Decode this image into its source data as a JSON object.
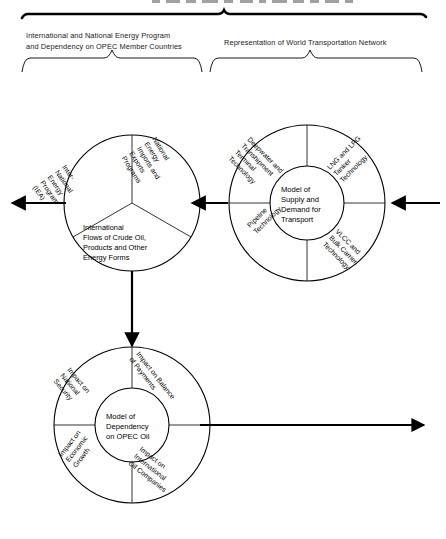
{
  "figure": {
    "title_cut_off": "",
    "braces": [
      {
        "id": "left",
        "label": "International and National Energy Program and Dependency on OPEC Member Countries",
        "line1": "International and National Energy Program",
        "line2": "and Dependency on OPEC Member Countries"
      },
      {
        "id": "right",
        "label": "Representation of World Transportation Network",
        "line1": "Representation of World Transportation Network",
        "line2": ""
      }
    ]
  },
  "diagram": {
    "energy_circle": {
      "name": "International and National Energy Programs circle",
      "segments": [
        {
          "id": "iea",
          "lines": [
            "Inter-",
            "National",
            "Energy",
            "Program",
            "(IEA)"
          ]
        },
        {
          "id": "imports",
          "lines": [
            "National",
            "Energy",
            "Imports and",
            "Exports",
            "Programs"
          ]
        },
        {
          "id": "flows",
          "lines": [
            "International",
            "Flows of Crude Oil,",
            "Products and Other",
            "Energy Forms"
          ]
        }
      ]
    },
    "transport_circle": {
      "name": "Model of Supply and Demand for Transport",
      "core": [
        "Model of",
        "Supply and",
        "Demand for",
        "Transport"
      ],
      "quadrants": [
        {
          "id": "deepwater",
          "lines": [
            "Deepwater and",
            "Transhipment",
            "Terminal",
            "Technology"
          ]
        },
        {
          "id": "lng_lpg",
          "lines": [
            "LNG and LPG",
            "Tanker",
            "Technology"
          ]
        },
        {
          "id": "pipeline",
          "lines": [
            "Pipeline",
            "Technology"
          ]
        },
        {
          "id": "vlcc",
          "lines": [
            "VLCC and",
            "Bulk Carrier",
            "Technology"
          ]
        }
      ]
    },
    "dependency_circle": {
      "name": "Model of Dependency on OPEC Oil",
      "core": [
        "Model of",
        "Dependency",
        "on OPEC Oil"
      ],
      "quadrants": [
        {
          "id": "national_security",
          "lines": [
            "Impact on",
            "National",
            "Security"
          ]
        },
        {
          "id": "balance_payments",
          "lines": [
            "Impact on Balance",
            "of Payments"
          ]
        },
        {
          "id": "economic_growth",
          "lines": [
            "Impact on",
            "Economic",
            "Growth"
          ]
        },
        {
          "id": "oil_companies",
          "lines": [
            "Impact on",
            "International",
            "Oil Companies"
          ]
        }
      ]
    },
    "arrows": [
      {
        "id": "arrow-right-in",
        "direction": "left"
      },
      {
        "id": "arrow-transport-to-energy",
        "direction": "left"
      },
      {
        "id": "arrow-energy-out",
        "direction": "left"
      },
      {
        "id": "arrow-energy-to-dependency",
        "direction": "down"
      },
      {
        "id": "arrow-dependency-out",
        "direction": "right"
      }
    ]
  },
  "colors": {
    "stroke": "#000000",
    "background": "#ffffff",
    "text": "#1a1a1a"
  }
}
